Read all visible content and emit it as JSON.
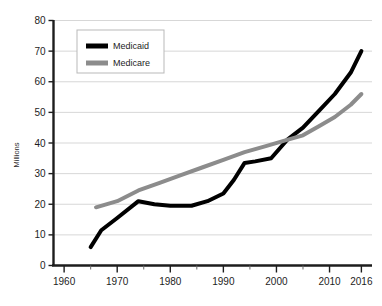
{
  "chart_data": {
    "type": "line",
    "title": "",
    "xlabel": "",
    "ylabel": "Millions",
    "xlim": [
      1958,
      2018
    ],
    "ylim": [
      0,
      80
    ],
    "yticks": [
      0,
      10,
      20,
      30,
      40,
      50,
      60,
      70,
      80
    ],
    "ytick_labels": [
      "0",
      "10",
      "20",
      "30",
      "40",
      "50",
      "60",
      "70",
      "80"
    ],
    "xticks": [
      1960,
      1970,
      1980,
      1990,
      2000,
      2010,
      2016
    ],
    "xtick_labels": [
      "1960",
      "1970",
      "1980",
      "1990",
      "2000",
      "2010",
      "2016"
    ],
    "xminor_ticks": [
      1965,
      1975,
      1985,
      1995,
      2005
    ],
    "grid": "horizontal",
    "legend_position": "top-left-inside",
    "series": [
      {
        "name": "Medicaid",
        "color": "#000000",
        "x": [
          1965,
          1967,
          1970,
          1974,
          1977,
          1980,
          1984,
          1987,
          1990,
          1992,
          1994,
          1996,
          1999,
          2002,
          2005,
          2008,
          2011,
          2014,
          2016
        ],
        "values": [
          6,
          11.5,
          15.5,
          21,
          20,
          19.5,
          19.5,
          21,
          23.5,
          28,
          33.5,
          34,
          35,
          41,
          45,
          50.5,
          56,
          63,
          70
        ]
      },
      {
        "name": "Medicare",
        "color": "#8c8c8c",
        "x": [
          1966,
          1970,
          1974,
          1978,
          1982,
          1986,
          1990,
          1994,
          1998,
          2002,
          2005,
          2008,
          2011,
          2014,
          2016
        ],
        "values": [
          19,
          21,
          24.5,
          27,
          29.5,
          32,
          34.5,
          37,
          39,
          41,
          42.5,
          45.5,
          48.5,
          52.5,
          56
        ]
      }
    ]
  },
  "legend": {
    "items": [
      {
        "label": "Medicaid",
        "color": "#000000"
      },
      {
        "label": "Medicare",
        "color": "#8c8c8c"
      }
    ]
  }
}
